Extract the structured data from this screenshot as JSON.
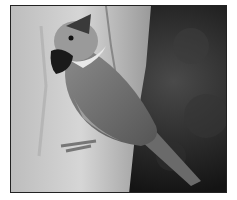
{
  "image": {
    "subject": "crested tit bird perched on tree trunk",
    "style": "grayscale photograph",
    "colors": {
      "frame": "#222222",
      "background_dark": "#111111",
      "bark_light": "#c8c8c8",
      "bird_body": "#7a7a7a"
    }
  }
}
